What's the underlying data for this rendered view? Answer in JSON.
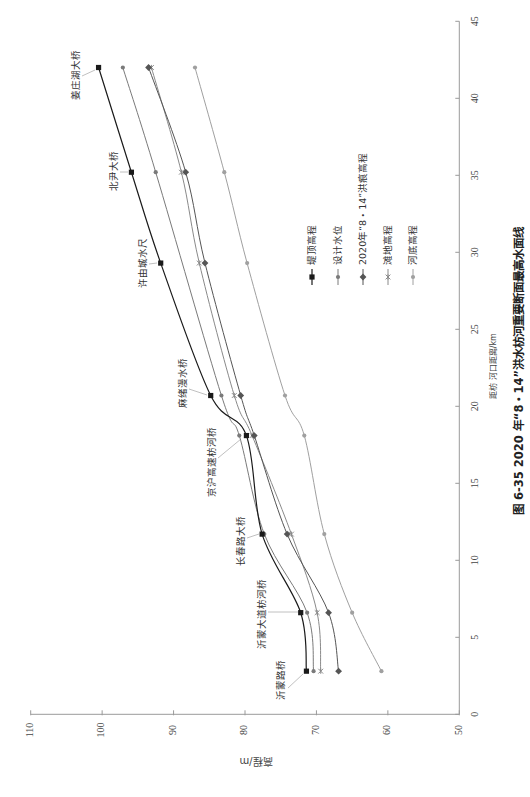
{
  "figure": {
    "caption": "图 6-35  2020 年“8・14”洪水枋河重要断面最高水面线"
  },
  "chart_data": {
    "type": "line",
    "orientation": "rotated 90° counterclockwise (distance axis on right, elevation axis on bottom)",
    "title": "图 6-35  2020 年“8・14”洪水枋河重要断面最高水面线",
    "xlabel": "距枋 河口距离/km",
    "ylabel": "高程/m",
    "xlim": [
      0,
      45
    ],
    "ylim": [
      50,
      110
    ],
    "xticks": [
      0,
      5,
      10,
      15,
      20,
      25,
      30,
      35,
      40,
      45
    ],
    "yticks": [
      110,
      100,
      90,
      80,
      70,
      60,
      50
    ],
    "grid": false,
    "legend_position": "inside plot, right of curves",
    "x": [
      2.8,
      6.6,
      11.7,
      18.1,
      20.7,
      29.3,
      35.2,
      42.0
    ],
    "stations": [
      "沂蒙路桥",
      "沂蒙大道枋河桥",
      "长春路大桥",
      "京沪高速枋河桥",
      "麻绪漫水桥",
      "许由城水尺",
      "北尹大桥",
      "姜庄湖大桥"
    ],
    "series": [
      {
        "name": "堤顶高程",
        "color": "#1a1a1a",
        "marker": "square",
        "values": [
          71.4,
          72.2,
          77.6,
          79.8,
          84.8,
          91.8,
          95.9,
          100.5
        ]
      },
      {
        "name": "设计水位",
        "color": "#7a7a7a",
        "marker": "circle",
        "values": [
          70.4,
          71.3,
          77.3,
          80.8,
          83.3,
          null,
          92.5,
          97.1
        ]
      },
      {
        "name": "2020年“8・14”洪痕高程",
        "color": "#555555",
        "marker": "diamond",
        "values": [
          66.9,
          68.3,
          74.1,
          78.7,
          80.6,
          85.6,
          88.3,
          93.5
        ]
      },
      {
        "name": "滩地高程",
        "color": "#8a8a8a",
        "marker": "x",
        "values": [
          69.4,
          69.9,
          73.5,
          79.0,
          81.5,
          86.4,
          88.9,
          93.1
        ]
      },
      {
        "name": "河底高程",
        "color": "#a0a0a0",
        "marker": "circle",
        "values": [
          60.9,
          65.0,
          68.9,
          71.7,
          74.4,
          79.7,
          82.9,
          87.0
        ]
      }
    ]
  }
}
